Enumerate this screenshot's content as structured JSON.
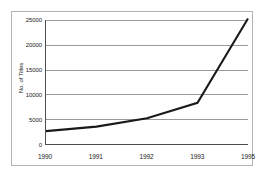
{
  "figure": {
    "frame_border_color": "#b3b3b3",
    "background_color": "#ffffff",
    "axis_color": "#4d4d4d",
    "grid_color": "#9a9a9a",
    "line_color": "#1a1a1a"
  },
  "chart_data": {
    "type": "line",
    "title": "",
    "xlabel": "",
    "ylabel": "No. of Titles",
    "x": [
      1990,
      1991,
      1992,
      1993,
      1995
    ],
    "categories": [
      "1990",
      "1991",
      "1992",
      "1993",
      "1995"
    ],
    "values": [
      2600,
      3500,
      5200,
      8300,
      25300
    ],
    "series": [
      {
        "name": "No. of Titles",
        "values": [
          2600,
          3500,
          5200,
          8300,
          25300
        ]
      }
    ],
    "ylim": [
      0,
      25000
    ],
    "yticks": [
      0,
      5000,
      10000,
      15000,
      20000,
      25000
    ],
    "ytick_labels": [
      "0",
      "5000",
      "10000",
      "15000",
      "20000",
      "25000"
    ],
    "xtick_labels": [
      "1990",
      "1991",
      "1992",
      "1993",
      "1995"
    ],
    "grid": "horizontal",
    "legend": "none",
    "markers": "none"
  }
}
